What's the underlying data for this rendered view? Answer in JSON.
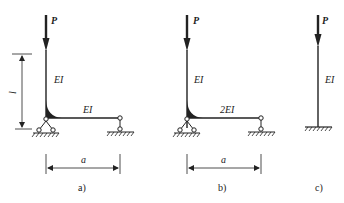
{
  "figure": {
    "panels": [
      {
        "id": "a",
        "caption": "a)",
        "load_label": "P",
        "column_label": "EI",
        "beam_label": "EI",
        "height_label": "l",
        "span_label": "a"
      },
      {
        "id": "b",
        "caption": "b)",
        "load_label": "P",
        "column_label": "EI",
        "beam_label": "2EI",
        "span_label": "a"
      },
      {
        "id": "c",
        "caption": "c)",
        "load_label": "P",
        "column_label": "EI"
      }
    ],
    "colors": {
      "line": "#222222",
      "background": "#ffffff"
    }
  }
}
